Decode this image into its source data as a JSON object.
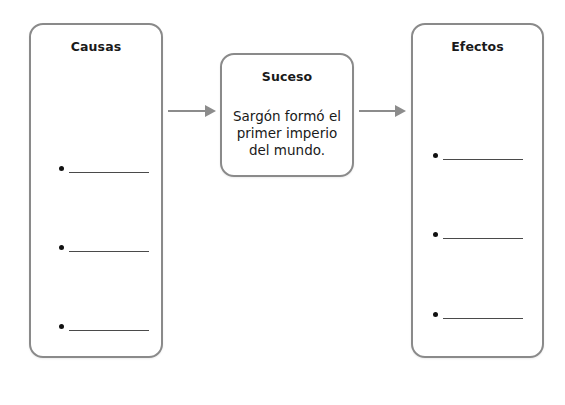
{
  "diagram": {
    "type": "cause-effect organizer",
    "causes": {
      "title": "Causas",
      "items": [
        "",
        "",
        ""
      ]
    },
    "event": {
      "title": "Suceso",
      "text_lines": [
        "Sargón formó el",
        "primer imperio",
        "del mundo."
      ]
    },
    "effects": {
      "title": "Efectos",
      "items": [
        "",
        "",
        ""
      ]
    },
    "connectors": [
      {
        "from": "causes",
        "to": "event",
        "icon": "arrow-right-icon"
      },
      {
        "from": "event",
        "to": "effects",
        "icon": "arrow-right-icon"
      }
    ],
    "colors": {
      "border": "#8a8a8a",
      "arrow": "#8c8c8c",
      "text": "#1a1a1a",
      "background": "#ffffff"
    }
  }
}
